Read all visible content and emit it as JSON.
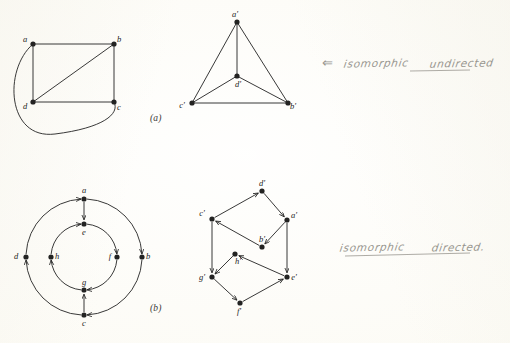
{
  "page": {
    "background_color": "#fdfcf7",
    "ink_color": "#232322",
    "pencil_color": "#8f8d86",
    "width": 510,
    "height": 343
  },
  "figures": [
    {
      "id": "figure-a",
      "caption": "(a)",
      "caption_x": 150,
      "caption_y": 113,
      "kind": "undirected",
      "graphs": [
        {
          "id": "graph-a-left",
          "name": "undirected-graph-abcd",
          "vertices": [
            {
              "id": "a",
              "label": "a",
              "x": 33,
              "y": 44,
              "label_dx": -8,
              "label_dy": -2
            },
            {
              "id": "b",
              "label": "b",
              "x": 114,
              "y": 44,
              "label_dx": 5,
              "label_dy": -2
            },
            {
              "id": "d",
              "label": "d",
              "x": 33,
              "y": 102,
              "label_dx": -8,
              "label_dy": 7
            },
            {
              "id": "c",
              "label": "c",
              "x": 114,
              "y": 102,
              "label_dx": 5,
              "label_dy": 8
            }
          ],
          "edges": [
            {
              "from": "a",
              "to": "b",
              "type": "line"
            },
            {
              "from": "a",
              "to": "d",
              "type": "line"
            },
            {
              "from": "b",
              "to": "c",
              "type": "line"
            },
            {
              "from": "d",
              "to": "c",
              "type": "line"
            },
            {
              "from": "d",
              "to": "b",
              "type": "line"
            },
            {
              "from": "a",
              "to": "c",
              "type": "curve",
              "note": "long arc sweeping left and below d"
            }
          ]
        },
        {
          "id": "graph-a-right",
          "name": "undirected-graph-abcd-prime",
          "vertices": [
            {
              "id": "a'",
              "label": "a'",
              "x": 237,
              "y": 22,
              "label_dx": -2,
              "label_dy": -5
            },
            {
              "id": "d'",
              "label": "d'",
              "x": 237,
              "y": 76,
              "label_dx": 1,
              "label_dy": 11
            },
            {
              "id": "c'",
              "label": "c'",
              "x": 192,
              "y": 103,
              "label_dx": -10,
              "label_dy": 5
            },
            {
              "id": "b'",
              "label": "b'",
              "x": 288,
              "y": 103,
              "label_dx": 5,
              "label_dy": 6
            }
          ],
          "edges": [
            {
              "from": "a'",
              "to": "d'",
              "type": "line"
            },
            {
              "from": "a'",
              "to": "c'",
              "type": "line"
            },
            {
              "from": "a'",
              "to": "b'",
              "type": "line"
            },
            {
              "from": "d'",
              "to": "c'",
              "type": "line"
            },
            {
              "from": "d'",
              "to": "b'",
              "type": "line"
            },
            {
              "from": "c'",
              "to": "b'",
              "type": "line"
            }
          ]
        }
      ]
    },
    {
      "id": "figure-b",
      "caption": "(b)",
      "caption_x": 150,
      "caption_y": 308,
      "kind": "directed",
      "graphs": [
        {
          "id": "graph-b-left",
          "name": "directed-graph-concentric-circles",
          "outer_circle": {
            "cx": 84,
            "cy": 257,
            "r": 58
          },
          "inner_circle": {
            "cx": 84,
            "cy": 257,
            "r": 33
          },
          "vertices": [
            {
              "id": "a",
              "label": "a",
              "x": 84,
              "y": 199,
              "label_dx": 0,
              "label_dy": -6
            },
            {
              "id": "b",
              "label": "b",
              "x": 142,
              "y": 257,
              "label_dx": 6,
              "label_dy": 2
            },
            {
              "id": "c",
              "label": "c",
              "x": 84,
              "y": 315,
              "label_dx": 0,
              "label_dy": 11
            },
            {
              "id": "d",
              "label": "d",
              "x": 26,
              "y": 257,
              "label_dx": -10,
              "label_dy": 2
            },
            {
              "id": "e",
              "label": "e",
              "x": 84,
              "y": 224,
              "label_dx": 0,
              "label_dy": 11
            },
            {
              "id": "f",
              "label": "f",
              "x": 117,
              "y": 257,
              "label_dx": -7,
              "label_dy": 2
            },
            {
              "id": "g",
              "label": "g",
              "x": 84,
              "y": 290,
              "label_dx": 0,
              "label_dy": -5
            },
            {
              "id": "h",
              "label": "h",
              "x": 51,
              "y": 257,
              "label_dx": 6,
              "label_dy": 2
            }
          ],
          "edges": [
            {
              "from": "a",
              "to": "b",
              "type": "arc-outer",
              "directed": true
            },
            {
              "from": "b",
              "to": "c",
              "type": "arc-outer",
              "directed": true
            },
            {
              "from": "c",
              "to": "d",
              "type": "arc-outer",
              "directed": true
            },
            {
              "from": "d",
              "to": "a",
              "type": "arc-outer",
              "directed": true
            },
            {
              "from": "e",
              "to": "f",
              "type": "arc-inner",
              "directed": true
            },
            {
              "from": "f",
              "to": "g",
              "type": "arc-inner",
              "directed": true
            },
            {
              "from": "g",
              "to": "h",
              "type": "arc-inner",
              "directed": true
            },
            {
              "from": "h",
              "to": "e",
              "type": "arc-inner",
              "directed": true
            },
            {
              "from": "a",
              "to": "e",
              "type": "line",
              "directed": true
            },
            {
              "from": "c",
              "to": "g",
              "type": "line",
              "directed": true
            }
          ]
        },
        {
          "id": "graph-b-right",
          "name": "directed-graph-two-hexagons",
          "vertices": [
            {
              "id": "d'",
              "label": "d'",
              "x": 262,
              "y": 191,
              "label_dx": 0,
              "label_dy": -5
            },
            {
              "id": "c'",
              "label": "c'",
              "x": 212,
              "y": 219,
              "label_dx": -10,
              "label_dy": -3
            },
            {
              "id": "a'",
              "label": "a'",
              "x": 287,
              "y": 220,
              "label_dx": 7,
              "label_dy": -2
            },
            {
              "id": "b'",
              "label": "b'",
              "x": 262,
              "y": 247,
              "label_dx": 0,
              "label_dy": -5
            },
            {
              "id": "h'",
              "label": "h'",
              "x": 235,
              "y": 254,
              "label_dx": 3,
              "label_dy": 10
            },
            {
              "id": "g'",
              "label": "g'",
              "x": 212,
              "y": 277,
              "label_dx": -10,
              "label_dy": 3
            },
            {
              "id": "e'",
              "label": "e'",
              "x": 287,
              "y": 277,
              "label_dx": 7,
              "label_dy": 3
            },
            {
              "id": "f'",
              "label": "f'",
              "x": 240,
              "y": 303,
              "label_dx": -1,
              "label_dy": 11
            }
          ],
          "edges": [
            {
              "from": "c'",
              "to": "d'",
              "type": "line",
              "directed": true
            },
            {
              "from": "d'",
              "to": "a'",
              "type": "line",
              "directed": true
            },
            {
              "from": "a'",
              "to": "b'",
              "type": "line",
              "directed": true
            },
            {
              "from": "b'",
              "to": "c'",
              "type": "line",
              "directed": true
            },
            {
              "from": "c'",
              "to": "g'",
              "type": "line",
              "directed": true
            },
            {
              "from": "a'",
              "to": "e'",
              "type": "line",
              "directed": true
            },
            {
              "from": "e'",
              "to": "h'",
              "type": "line",
              "directed": true
            },
            {
              "from": "h'",
              "to": "g'",
              "type": "line",
              "directed": true
            },
            {
              "from": "g'",
              "to": "f'",
              "type": "line",
              "directed": true
            },
            {
              "from": "f'",
              "to": "e'",
              "type": "line",
              "directed": true
            }
          ]
        }
      ]
    }
  ],
  "annotations": [
    {
      "id": "note-undirected",
      "name": "handwritten-note-undirected",
      "arrow_glyph": "⇐",
      "words": [
        "isomorphic",
        "undirected"
      ],
      "full_text": "⇐ isomorphic undirected",
      "x": 322,
      "y": 52,
      "underlined_word": "undirected"
    },
    {
      "id": "note-directed",
      "name": "handwritten-note-directed",
      "arrow_glyph": "",
      "words": [
        "isomorphic",
        "directed."
      ],
      "full_text": "isomorphic directed.",
      "x": 340,
      "y": 236,
      "underlined_word": "directed."
    }
  ]
}
